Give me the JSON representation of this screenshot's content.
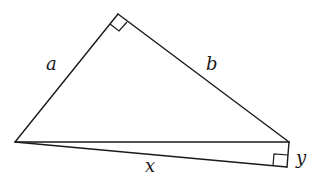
{
  "diagram": {
    "type": "geometry",
    "vertices": {
      "top": [
        118,
        14
      ],
      "left": [
        15,
        142
      ],
      "right": [
        289,
        142
      ],
      "bottom_right": [
        287,
        167
      ]
    },
    "edges": [
      {
        "from": "left",
        "to": "top",
        "label": "a"
      },
      {
        "from": "top",
        "to": "right",
        "label": "b"
      },
      {
        "from": "left",
        "to": "right",
        "label": ""
      },
      {
        "from": "left",
        "to": "bottom_right",
        "label": "x"
      },
      {
        "from": "right",
        "to": "bottom_right",
        "label": "y"
      }
    ],
    "right_angles": [
      "top",
      "bottom_right"
    ],
    "labels": {
      "a": "a",
      "b": "b",
      "x": "x",
      "y": "y"
    },
    "colors": {
      "line": "#1a1a1a",
      "background": "#ffffff"
    }
  }
}
